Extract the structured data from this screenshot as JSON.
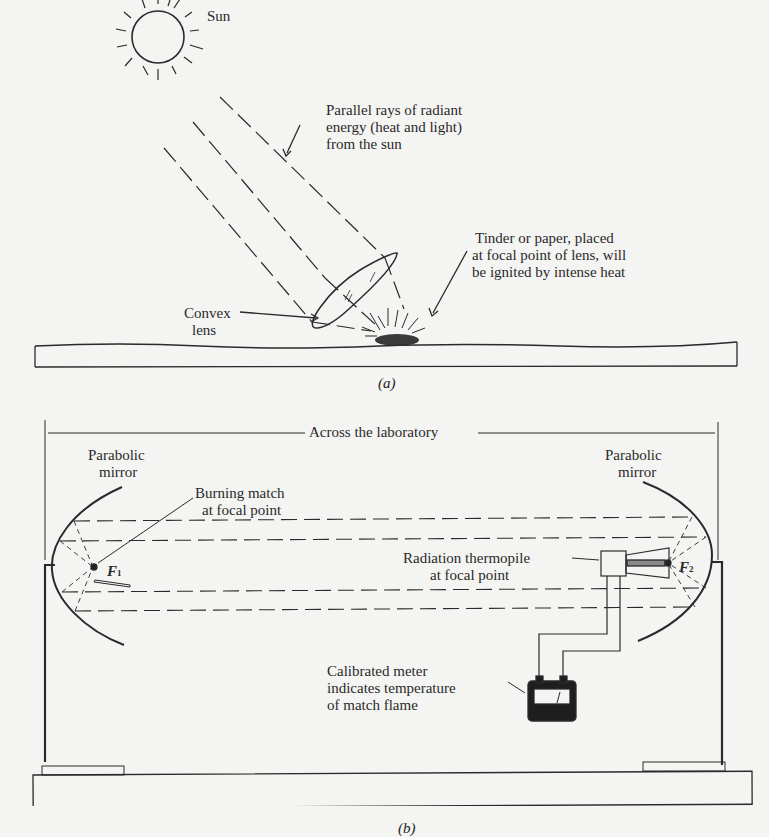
{
  "panel_a": {
    "caption": "(a)",
    "labels": {
      "sun": "Sun",
      "rays_line1": "Parallel rays of radiant",
      "rays_line2": "energy (heat and light)",
      "rays_line3": "from the sun",
      "tinder_line1": "Tinder or paper, placed",
      "tinder_line2": "at focal point of lens, will",
      "tinder_line3": "be ignited by intense heat",
      "lens_line1": "Convex",
      "lens_line2": "lens"
    }
  },
  "panel_b": {
    "caption": "(b)",
    "labels": {
      "across": "Across the laboratory",
      "left_mirror_line1": "Parabolic",
      "left_mirror_line2": "mirror",
      "right_mirror_line1": "Parabolic",
      "right_mirror_line2": "mirror",
      "match_line1": "Burning match",
      "match_line2": "at focal point",
      "f1": "F",
      "f1_sub": "1",
      "f2": "F",
      "f2_sub": "2",
      "thermopile_line1": "Radiation thermopile",
      "thermopile_line2": "at focal point",
      "meter_line1": "Calibrated meter",
      "meter_line2": "indicates temperature",
      "meter_line3": "of match flame"
    }
  }
}
